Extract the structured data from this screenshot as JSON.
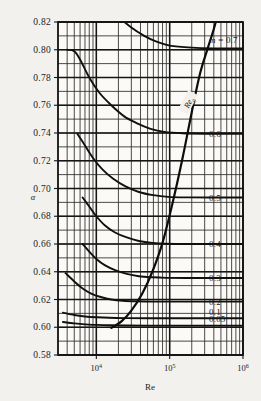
{
  "chart_data": {
    "type": "line",
    "title": "",
    "xlabel": "Re",
    "ylabel": "α",
    "xscale": "log",
    "xlim": [
      3000,
      1000000
    ],
    "ylim": [
      0.58,
      0.82
    ],
    "grid": true,
    "legend": "right-edge-curve-labels",
    "xticks": [
      {
        "value": 10000,
        "label": "10",
        "exponent": "4"
      },
      {
        "value": 100000,
        "label": "10",
        "exponent": "5"
      },
      {
        "value": 1000000,
        "label": "10",
        "exponent": "6"
      }
    ],
    "yticks": [
      "0.82",
      "0.80",
      "0.78",
      "0.76",
      "0.74",
      "0.72",
      "0.70",
      "0.68",
      "0.66",
      "0.64",
      "0.62",
      "0.60",
      "0.58"
    ],
    "series": [
      {
        "name": "m = 0.7",
        "label": "m = 0.7",
        "m": 0.7,
        "asymptote": 0.801,
        "points": [
          [
            7000,
            0.862
          ],
          [
            10000,
            0.845
          ],
          [
            14000,
            0.833
          ],
          [
            20000,
            0.824
          ],
          [
            30000,
            0.816
          ],
          [
            45000,
            0.81
          ],
          [
            65000,
            0.806
          ],
          [
            100000,
            0.803
          ],
          [
            200000,
            0.8015
          ],
          [
            400000,
            0.801
          ],
          [
            1000000,
            0.801
          ]
        ]
      },
      {
        "name": "0.6",
        "label": "0.6",
        "m": 0.6,
        "asymptote": 0.7395,
        "points": [
          [
            4000,
            0.8
          ],
          [
            5000,
            0.799
          ],
          [
            6000,
            0.793
          ],
          [
            8000,
            0.78
          ],
          [
            11000,
            0.769
          ],
          [
            16000,
            0.76
          ],
          [
            24000,
            0.752
          ],
          [
            36000,
            0.747
          ],
          [
            55000,
            0.743
          ],
          [
            85000,
            0.7408
          ],
          [
            150000,
            0.7398
          ],
          [
            300000,
            0.7395
          ],
          [
            1000000,
            0.7395
          ]
        ]
      },
      {
        "name": "0.5",
        "label": "0.5",
        "m": 0.5,
        "asymptote": 0.6935,
        "points": [
          [
            5500,
            0.7395
          ],
          [
            7000,
            0.731
          ],
          [
            9000,
            0.722
          ],
          [
            12000,
            0.714
          ],
          [
            17000,
            0.707
          ],
          [
            25000,
            0.7015
          ],
          [
            38000,
            0.6975
          ],
          [
            60000,
            0.6952
          ],
          [
            95000,
            0.694
          ],
          [
            180000,
            0.6936
          ],
          [
            400000,
            0.6935
          ],
          [
            1000000,
            0.6935
          ]
        ]
      },
      {
        "name": "0.4",
        "label": "0.4",
        "m": 0.4,
        "asymptote": 0.66,
        "points": [
          [
            6500,
            0.6935
          ],
          [
            8000,
            0.687
          ],
          [
            10000,
            0.68
          ],
          [
            13000,
            0.6735
          ],
          [
            18000,
            0.6683
          ],
          [
            26000,
            0.6647
          ],
          [
            38000,
            0.6622
          ],
          [
            58000,
            0.6608
          ],
          [
            90000,
            0.6602
          ],
          [
            180000,
            0.66
          ],
          [
            1000000,
            0.66
          ]
        ]
      },
      {
        "name": "0.3",
        "label": "0.3",
        "m": 0.3,
        "asymptote": 0.6355,
        "points": [
          [
            6500,
            0.66
          ],
          [
            8000,
            0.6545
          ],
          [
            10000,
            0.6492
          ],
          [
            13000,
            0.6448
          ],
          [
            18000,
            0.6412
          ],
          [
            26000,
            0.6385
          ],
          [
            38000,
            0.6368
          ],
          [
            58000,
            0.636
          ],
          [
            90000,
            0.6356
          ],
          [
            180000,
            0.6355
          ],
          [
            1000000,
            0.6355
          ]
        ]
      },
      {
        "name": "0.2",
        "label": "0.2",
        "m": 0.2,
        "asymptote": 0.6185,
        "points": [
          [
            3800,
            0.639
          ],
          [
            5000,
            0.633
          ],
          [
            6500,
            0.628
          ],
          [
            8500,
            0.6243
          ],
          [
            11500,
            0.6218
          ],
          [
            16000,
            0.62
          ],
          [
            23000,
            0.6191
          ],
          [
            35000,
            0.6187
          ],
          [
            60000,
            0.6185
          ],
          [
            150000,
            0.6185
          ],
          [
            1000000,
            0.6185
          ]
        ]
      },
      {
        "name": "0.1",
        "label": "0.1",
        "m": 0.1,
        "asymptote": 0.6065,
        "points": [
          [
            3500,
            0.6105
          ],
          [
            5000,
            0.6088
          ],
          [
            7000,
            0.6078
          ],
          [
            10000,
            0.6072
          ],
          [
            15000,
            0.6068
          ],
          [
            25000,
            0.6066
          ],
          [
            50000,
            0.6065
          ],
          [
            150000,
            0.6065
          ],
          [
            1000000,
            0.6065
          ]
        ]
      },
      {
        "name": "0.05",
        "label": "0.05",
        "m": 0.05,
        "asymptote": 0.6012,
        "points": [
          [
            3500,
            0.6038
          ],
          [
            5000,
            0.6028
          ],
          [
            7000,
            0.6021
          ],
          [
            10000,
            0.6017
          ],
          [
            15000,
            0.6014
          ],
          [
            25000,
            0.6013
          ],
          [
            50000,
            0.6012
          ],
          [
            150000,
            0.6012
          ],
          [
            1000000,
            0.6012
          ]
        ]
      }
    ],
    "boundary_curve": {
      "name": "Re_g",
      "label": "Re",
      "sublabel": "g",
      "points": [
        [
          16000,
          0.5995
        ],
        [
          22000,
          0.6042
        ],
        [
          30000,
          0.612
        ],
        [
          42000,
          0.624
        ],
        [
          58000,
          0.64
        ],
        [
          80000,
          0.661
        ],
        [
          110000,
          0.69
        ],
        [
          150000,
          0.722
        ],
        [
          200000,
          0.755
        ],
        [
          260000,
          0.783
        ],
        [
          330000,
          0.801
        ],
        [
          400000,
          0.815
        ],
        [
          460000,
          0.827
        ]
      ]
    },
    "right_labels": [
      "m = 0.7",
      "0.6",
      "0.5",
      "0.4",
      "0.3",
      "0.2",
      "0.1",
      "0.05"
    ]
  }
}
